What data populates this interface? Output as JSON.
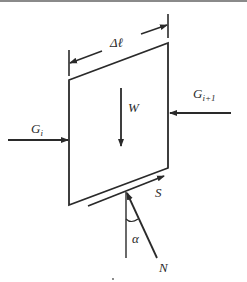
{
  "diagram": {
    "labels": {
      "width": "Δℓ",
      "weight": "W",
      "left_force": "G",
      "left_force_sub": "i",
      "right_force": "G",
      "right_force_sub": "i+1",
      "shear": "S",
      "normal": "N",
      "angle": "α"
    },
    "colors": {
      "stroke": "#2a2a2a",
      "background": "#ffffff"
    }
  }
}
